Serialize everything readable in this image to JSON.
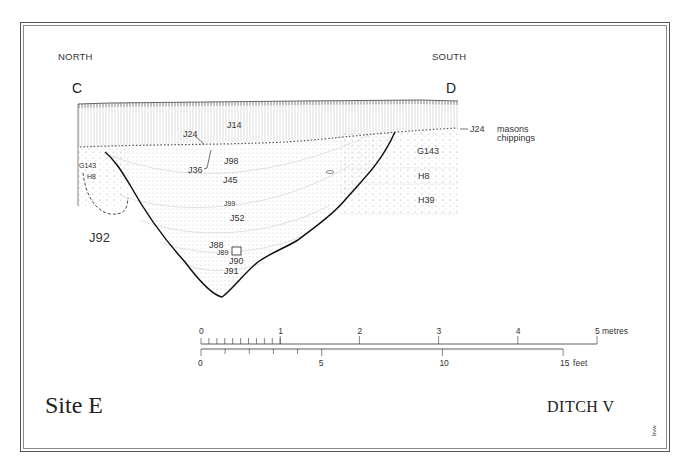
{
  "title": {
    "site": "Site E",
    "feature": "DITCH  V"
  },
  "orientation": {
    "left": "NORTH",
    "right": "SOUTH"
  },
  "section_points": {
    "start": "C",
    "end": "D"
  },
  "layers": {
    "J14": "J14",
    "J24": "J24",
    "J36": "J36",
    "J98": "J98",
    "J45": "J45",
    "J99": "J99",
    "J52": "J52",
    "J88": "J88",
    "J89": "J89",
    "J90": "J90",
    "J91": "J91",
    "J92": "J92",
    "G143_left": "G143",
    "H8_left": "H8",
    "G143_right": "G143",
    "H8_right": "H8",
    "H39": "H39"
  },
  "annotation": {
    "ref": "J24",
    "note_line1": "masons",
    "note_line2": "chippings"
  },
  "scale": {
    "metric_labels": [
      "0",
      "1",
      "2",
      "3",
      "4",
      "5"
    ],
    "metric_unit": "metres",
    "imperial_labels": [
      "0",
      "5",
      "10",
      "15"
    ],
    "imperial_unit": "feet"
  },
  "credit": "bvw"
}
